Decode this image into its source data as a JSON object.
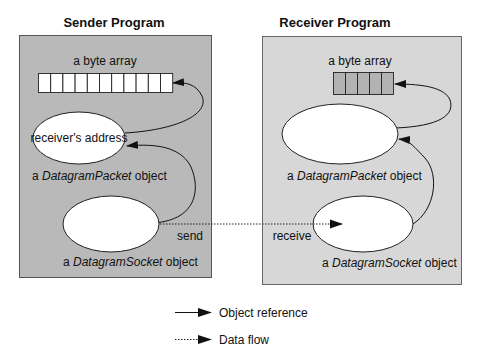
{
  "sender": {
    "title": "Sender Program",
    "byte_array_label": "a byte array",
    "byte_array_cells": 11,
    "packet_ellipse_text": "receiver's address",
    "packet_label_prefix": "a ",
    "packet_label_class": "DatagramPacket",
    "packet_label_suffix": " object",
    "socket_label_prefix": "a ",
    "socket_label_class": "DatagramSocket",
    "socket_label_suffix": " object",
    "send_label": "send",
    "fill_color": "#b9b9b9"
  },
  "receiver": {
    "title": "Receiver Program",
    "byte_array_label": "a byte array",
    "byte_array_cells": 5,
    "packet_label_prefix": "a ",
    "packet_label_class": "DatagramPacket",
    "packet_label_suffix": " object",
    "socket_label_prefix": "a ",
    "socket_label_class": "DatagramSocket",
    "socket_label_suffix": " object",
    "receive_label": "receive",
    "fill_color": "#d7d7d7"
  },
  "legend": {
    "items": [
      {
        "icon": "solid-arrow-icon",
        "label": "Object reference"
      },
      {
        "icon": "dotted-arrow-icon",
        "label": "Data flow"
      }
    ]
  }
}
